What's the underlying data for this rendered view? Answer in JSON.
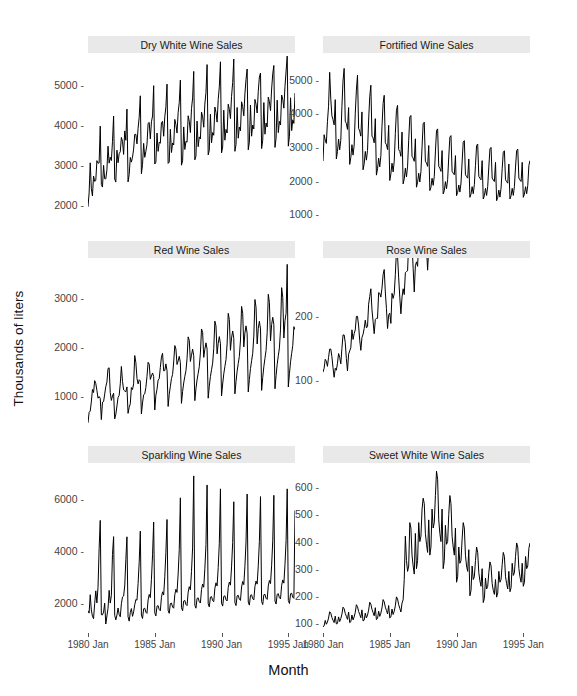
{
  "chart_data": {
    "type": "line",
    "title": "",
    "xlabel": "Month",
    "ylabel": "Thousands of liters",
    "layout": {
      "rows": 3,
      "cols": 2,
      "facet_strip_position": "top",
      "grid": false,
      "legend": "none"
    },
    "x_axis": {
      "label": "Month",
      "ticks": [
        "1980 Jan",
        "1985 Jan",
        "1990 Jan",
        "1995 Jan"
      ],
      "tick_values": [
        1980.0,
        1985.0,
        1990.0,
        1995.0
      ],
      "range": [
        1980.0,
        1995.5
      ]
    },
    "panels": [
      {
        "id": "dry-white",
        "title": "Dry White Wine Sales",
        "row": 0,
        "col": 0,
        "ylim": [
          1600,
          5800
        ],
        "yticks": [
          2000,
          3000,
          4000,
          5000
        ],
        "values": [
          1954,
          2302,
          3054,
          2414,
          2226,
          2725,
          2589,
          2615,
          3109,
          3044,
          3052,
          3973,
          2510,
          2448,
          2991,
          2656,
          2654,
          2878,
          3471,
          3047,
          3194,
          3111,
          3584,
          4225,
          2650,
          2573,
          3370,
          3057,
          3285,
          3331,
          3688,
          3593,
          3264,
          3852,
          3618,
          4398,
          2578,
          2759,
          3190,
          3072,
          3198,
          3398,
          3766,
          3767,
          3527,
          3916,
          4193,
          4730,
          2781,
          3010,
          3541,
          3192,
          3342,
          3506,
          4042,
          4064,
          3655,
          4080,
          4226,
          4983,
          3025,
          3070,
          3800,
          3341,
          3569,
          3544,
          4061,
          4092,
          3719,
          4205,
          4452,
          5022,
          3041,
          3076,
          3893,
          3312,
          3551,
          3500,
          4140,
          4010,
          3799,
          4310,
          4561,
          5123,
          2996,
          3104,
          3951,
          3388,
          3593,
          3569,
          4231,
          4095,
          3811,
          4409,
          4677,
          5340,
          3130,
          3222,
          4097,
          3458,
          3702,
          3651,
          4322,
          4207,
          3944,
          4523,
          4818,
          5510,
          3254,
          3372,
          4268,
          3554,
          3811,
          3744,
          4450,
          4314,
          4072,
          4636,
          4955,
          5580,
          3302,
          3451,
          4371,
          3620,
          3889,
          3800,
          4520,
          4395,
          4160,
          4718,
          5063,
          5650,
          3342,
          3513,
          4438,
          3670,
          3950,
          3856,
          4580,
          4460,
          4230,
          4780,
          5140,
          5400,
          3380,
          3570,
          4500,
          3720,
          4000,
          3900,
          4640,
          4520,
          4300,
          4840,
          5200,
          5300,
          3410,
          3620,
          4560,
          3770,
          4050,
          3950,
          4700,
          4580,
          4360,
          4900,
          5280,
          5488,
          3440,
          3670,
          4620,
          3810,
          4090,
          4000,
          4750,
          4640,
          4420,
          4960,
          5350,
          5723,
          3470,
          3720,
          4680,
          3860,
          4130,
          4040,
          4800
        ]
      },
      {
        "id": "fortified",
        "title": "Fortified Wine Sales",
        "row": 0,
        "col": 1,
        "ylim": [
          800,
          5800
        ],
        "yticks": [
          1000,
          2000,
          3000,
          4000,
          5000
        ],
        "values": [
          2585,
          3368,
          3210,
          3111,
          3756,
          4216,
          5225,
          4426,
          3932,
          3816,
          3661,
          4412,
          2645,
          2872,
          3237,
          2917,
          3206,
          4205,
          4969,
          5341,
          3770,
          3701,
          3526,
          4176,
          2485,
          2693,
          3071,
          2761,
          3061,
          4005,
          4695,
          5141,
          3558,
          3471,
          3326,
          4046,
          2325,
          2503,
          2871,
          2611,
          2901,
          3805,
          4495,
          4841,
          3328,
          3271,
          3126,
          3846,
          2165,
          2353,
          2671,
          2411,
          2741,
          3605,
          4295,
          4541,
          3128,
          3071,
          2926,
          3646,
          2005,
          2203,
          2521,
          2261,
          2581,
          3405,
          4095,
          4241,
          2928,
          2871,
          2726,
          3446,
          1905,
          2053,
          2371,
          2111,
          2431,
          3205,
          3895,
          3941,
          2728,
          2671,
          2576,
          3246,
          1805,
          1953,
          2221,
          1961,
          2281,
          3005,
          3695,
          3741,
          2578,
          2521,
          2426,
          3046,
          1705,
          1803,
          2071,
          1861,
          2131,
          2855,
          3495,
          3541,
          2428,
          2371,
          2276,
          2896,
          1605,
          1703,
          1971,
          1761,
          2031,
          2705,
          3295,
          3341,
          2278,
          2221,
          2176,
          2746,
          1555,
          1653,
          1871,
          1661,
          1931,
          2555,
          3145,
          3191,
          2178,
          2121,
          2076,
          2646,
          1505,
          1603,
          1821,
          1611,
          1881,
          2455,
          3045,
          3091,
          2128,
          2071,
          2026,
          2596,
          1455,
          1553,
          1771,
          1561,
          1831,
          2405,
          2945,
          2991,
          2078,
          2021,
          1976,
          2546,
          1405,
          1503,
          1721,
          1511,
          1781,
          2355,
          2845,
          2891,
          2028,
          1971,
          1926,
          2496,
          1455,
          1553,
          1771,
          1561,
          1831,
          2405,
          2895,
          2941,
          2078,
          2021,
          1976,
          2546,
          1505,
          1603,
          1821,
          1611,
          1861,
          2455,
          2600
        ]
      },
      {
        "id": "red",
        "title": "Red Wine Sales",
        "row": 1,
        "col": 0,
        "ylim": [
          400,
          3800
        ],
        "yticks": [
          1000,
          2000,
          3000
        ],
        "values": [
          464,
          675,
          703,
          887,
          1139,
          1077,
          1318,
          1260,
          1120,
          963,
          996,
          960,
          530,
          883,
          894,
          1045,
          1199,
          1287,
          1565,
          1577,
          1076,
          918,
          1008,
          1063,
          544,
          635,
          804,
          980,
          1018,
          1253,
          1605,
          1302,
          1130,
          1109,
          1093,
          1191,
          656,
          779,
          849,
          1178,
          1139,
          1254,
          1826,
          1685,
          1365,
          1252,
          1336,
          1312,
          642,
          866,
          1032,
          1050,
          1180,
          1399,
          1690,
          1652,
          1344,
          1413,
          1473,
          1404,
          724,
          1023,
          1143,
          1330,
          1357,
          1587,
          1794,
          1871,
          1516,
          1522,
          1657,
          1520,
          795,
          1042,
          1201,
          1362,
          1443,
          1696,
          2028,
          1959,
          1644,
          1716,
          1810,
          1683,
          858,
          1099,
          1271,
          1404,
          1517,
          1763,
          2204,
          2133,
          1706,
          1833,
          1957,
          1824,
          913,
          1153,
          1332,
          1466,
          1599,
          1879,
          2364,
          2295,
          1788,
          1954,
          2083,
          1955,
          963,
          1205,
          1399,
          1538,
          1672,
          1970,
          2523,
          2424,
          1860,
          2074,
          2209,
          2064,
          1010,
          1250,
          1455,
          1603,
          1744,
          2060,
          2680,
          2556,
          1933,
          2183,
          2323,
          2174,
          1051,
          1299,
          1509,
          1664,
          1810,
          2140,
          2820,
          2680,
          2000,
          2283,
          2426,
          2274,
          1090,
          1342,
          1560,
          1720,
          1870,
          2220,
          2960,
          2800,
          2060,
          2373,
          2520,
          2364,
          1120,
          1380,
          1600,
          1770,
          1930,
          2290,
          3065,
          2900,
          2120,
          2453,
          2600,
          2450,
          1153,
          1420,
          1650,
          1820,
          1980,
          2360,
          3200,
          3000,
          2180,
          2530,
          2680,
          3671,
          1190,
          1460,
          1700,
          1870,
          2030,
          2410,
          2350
        ]
      },
      {
        "id": "rose",
        "title": "Rose Wine Sales",
        "row": 1,
        "col": 1,
        "ylim": [
          28,
          290
        ],
        "yticks": [
          100,
          200
        ],
        "values": [
          112,
          118,
          132,
          129,
          121,
          135,
          148,
          148,
          136,
          119,
          104,
          118,
          115,
          126,
          141,
          135,
          125,
          149,
          170,
          170,
          158,
          133,
          114,
          140,
          145,
          150,
          178,
          163,
          172,
          178,
          199,
          199,
          184,
          162,
          146,
          166,
          171,
          180,
          193,
          181,
          183,
          218,
          230,
          242,
          209,
          191,
          172,
          194,
          196,
          196,
          236,
          235,
          229,
          243,
          264,
          272,
          237,
          211,
          180,
          201,
          204,
          188,
          235,
          227,
          234,
          264,
          302,
          293,
          259,
          229,
          203,
          229,
          242,
          233,
          267,
          269,
          270,
          315,
          364,
          347,
          312,
          274,
          237,
          278,
          284,
          277,
          317,
          313,
          318,
          374,
          413,
          405,
          355,
          306,
          271,
          306,
          315,
          301,
          356,
          348,
          355,
          422,
          465,
          467,
          404,
          347,
          305,
          336,
          340,
          318,
          362,
          348,
          363,
          435,
          491,
          505,
          404,
          359,
          310,
          337,
          360,
          342,
          406,
          396,
          420,
          472,
          548,
          559,
          463,
          407,
          362,
          405,
          417,
          391,
          419,
          461,
          472,
          535,
          622,
          606,
          508,
          461,
          390,
          432,
          420,
          396,
          447,
          429,
          471,
          538,
          612,
          613,
          528,
          458,
          424,
          468,
          440,
          420,
          470,
          450,
          490,
          560,
          630,
          640,
          550,
          480,
          440,
          490,
          450,
          430,
          480,
          460,
          500,
          570,
          650,
          660,
          560,
          490,
          450,
          500,
          460,
          440,
          490,
          470,
          510,
          580,
          660
        ]
      },
      {
        "id": "sparkling",
        "title": "Sparkling Wine Sales",
        "row": 2,
        "col": 0,
        "ylim": [
          900,
          7400
        ],
        "yticks": [
          2000,
          4000,
          6000
        ],
        "values": [
          1686,
          1591,
          2304,
          1712,
          1471,
          1377,
          1966,
          2453,
          1984,
          2596,
          4087,
          5179,
          1530,
          1523,
          1633,
          1976,
          1170,
          1480,
          1781,
          2472,
          1981,
          2273,
          3857,
          4551,
          1510,
          1329,
          1518,
          1790,
          1537,
          1449,
          1954,
          2218,
          2253,
          2643,
          3656,
          4544,
          1450,
          1282,
          1612,
          1768,
          1468,
          1640,
          1914,
          2118,
          2094,
          2731,
          3556,
          4764,
          1520,
          1383,
          1760,
          1782,
          1626,
          1582,
          2104,
          2315,
          2193,
          2903,
          3847,
          5114,
          1600,
          1483,
          1860,
          1882,
          1726,
          1682,
          2204,
          2415,
          2293,
          3003,
          3947,
          5214,
          1700,
          1583,
          1960,
          1982,
          1826,
          1782,
          2304,
          2515,
          2393,
          3103,
          4047,
          6053,
          1800,
          1683,
          2060,
          2082,
          1926,
          1882,
          2404,
          2615,
          2493,
          3203,
          4147,
          6900,
          1900,
          1783,
          2160,
          2182,
          2026,
          1982,
          2504,
          2715,
          2593,
          3303,
          4247,
          6550,
          1950,
          1833,
          2210,
          2232,
          2076,
          2032,
          2554,
          2765,
          2643,
          3353,
          4297,
          6400,
          1980,
          1863,
          2240,
          2262,
          2106,
          2062,
          2584,
          2795,
          2673,
          3383,
          4327,
          5900,
          2000,
          1883,
          2260,
          2282,
          2126,
          2082,
          2604,
          2815,
          2693,
          3403,
          4347,
          6200,
          2020,
          1903,
          2280,
          2302,
          2146,
          2102,
          2624,
          2835,
          2713,
          3423,
          4367,
          6100,
          2040,
          1923,
          2300,
          2322,
          2166,
          2122,
          2644,
          2855,
          2733,
          3443,
          4387,
          6150,
          2060,
          1943,
          2320,
          2342,
          2186,
          2142,
          2664,
          2875,
          2753,
          3463,
          4407,
          6400,
          2080,
          1963,
          2340,
          2362,
          2206,
          2162,
          5560
        ]
      },
      {
        "id": "sweet-white",
        "title": "Sweet White Wine Sales",
        "row": 2,
        "col": 1,
        "ylim": [
          70,
          690
        ],
        "yticks": [
          100,
          200,
          300,
          400,
          500,
          600
        ],
        "values": [
          85,
          89,
          109,
          95,
          103,
          118,
          141,
          136,
          120,
          110,
          101,
          125,
          96,
          98,
          122,
          105,
          116,
          132,
          158,
          152,
          135,
          124,
          113,
          140,
          101,
          104,
          129,
          111,
          122,
          139,
          167,
          160,
          142,
          131,
          119,
          148,
          107,
          110,
          136,
          118,
          129,
          147,
          176,
          169,
          150,
          138,
          126,
          156,
          112,
          116,
          143,
          124,
          136,
          155,
          186,
          178,
          158,
          146,
          133,
          164,
          118,
          122,
          151,
          131,
          143,
          163,
          196,
          188,
          167,
          154,
          140,
          173,
          185,
          260,
          420,
          330,
          290,
          310,
          470,
          450,
          350,
          310,
          280,
          430,
          300,
          330,
          470,
          400,
          420,
          520,
          560,
          540,
          430,
          390,
          360,
          480,
          350,
          380,
          520,
          450,
          470,
          570,
          660,
          630,
          480,
          430,
          400,
          520,
          300,
          330,
          460,
          390,
          400,
          500,
          570,
          540,
          420,
          380,
          350,
          450,
          250,
          270,
          380,
          320,
          330,
          410,
          470,
          450,
          350,
          310,
          290,
          370,
          200,
          220,
          310,
          260,
          270,
          330,
          380,
          360,
          285,
          255,
          235,
          300,
          175,
          190,
          265,
          225,
          235,
          285,
          325,
          310,
          245,
          220,
          205,
          260,
          195,
          210,
          290,
          250,
          260,
          315,
          360,
          345,
          270,
          245,
          225,
          290,
          215,
          230,
          320,
          275,
          285,
          345,
          395,
          380,
          300,
          270,
          250,
          320,
          235,
          250,
          345,
          300,
          310,
          375,
          395
        ]
      }
    ]
  }
}
